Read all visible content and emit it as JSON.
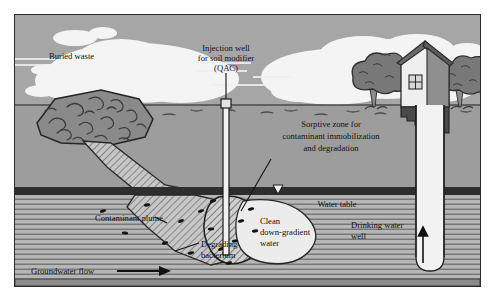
{
  "figure": {
    "type": "cross-section-diagram"
  },
  "labels": {
    "buried_waste": "Buried waste",
    "injection_well_l1": "Injection well",
    "injection_well_l2": "for soil modifier",
    "injection_well_l3": "(QAC)",
    "sorptive_zone_l1": "Sorptive zone for",
    "sorptive_zone_l2": "contaminant immobilization",
    "sorptive_zone_l3": "and degradation",
    "water_table_right": "Water table",
    "water_table_left": "Water table",
    "contaminant_plume": "Contaminant plume",
    "degrading_bacterium_l1": "Degrading",
    "degrading_bacterium_l2": "bacterium",
    "clean_water_l1": "Clean",
    "clean_water_l2": "down-gradient",
    "clean_water_l3": "water",
    "drinking_well_l1": "Drinking water",
    "drinking_well_l2": "well",
    "groundwater_flow": "Groundwater flow"
  },
  "colors": {
    "sky": "#a6a6a6",
    "cloud": "#f4f4f4",
    "unsaturated_soil": "#9d9d9d",
    "water_table_band": "#2e2e2e",
    "saturated_soil": "#b4b4b4",
    "saturated_line": "#555555",
    "waste_mound": "#8a8a8a",
    "plume_fill": "#c6c6c6",
    "clean_water_fill": "#ececec",
    "well_pipe": "#f2f2f2",
    "house_wall": "#efefef",
    "house_roof": "#6a6a6a",
    "house_foundation": "#4a4a4a",
    "tree_canopy": "#777777",
    "ink": "#111111",
    "frame": "#2b2b2b"
  },
  "elements": {
    "groundwater_flow_arrow": "right-arrow",
    "water_table_marker": "down-triangle",
    "drinking_well_arrow": "up-arrow",
    "house": "house-icon",
    "trees": [
      "tree-icon",
      "tree-icon"
    ],
    "bacteria_count_plume": 12,
    "bacteria_count_sorptive": 9
  }
}
